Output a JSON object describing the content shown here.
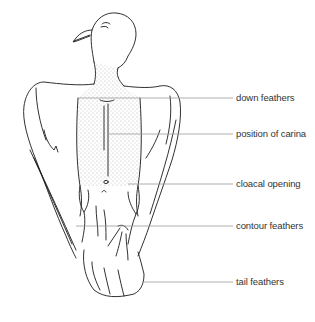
{
  "diagram": {
    "labels": [
      {
        "text": "down feathers",
        "y": 98,
        "line_start_x": 110
      },
      {
        "text": "position of carina",
        "y": 134,
        "line_start_x": 110
      },
      {
        "text": "cloacal opening",
        "y": 184,
        "line_start_x": 125
      },
      {
        "text": "contour feathers",
        "y": 226,
        "line_start_x": 120
      },
      {
        "text": "tail feathers",
        "y": 282,
        "line_start_x": 142
      }
    ],
    "colors": {
      "line": "#9a9a9a",
      "ink": "#1a1a1a",
      "text": "#333333"
    }
  }
}
